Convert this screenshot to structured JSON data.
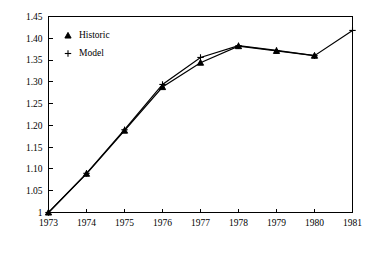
{
  "chart_data": {
    "type": "line",
    "title": "",
    "xlabel": "",
    "ylabel": "",
    "x": [
      1973,
      1974,
      1975,
      1976,
      1977,
      1978,
      1979,
      1980,
      1981
    ],
    "categories": [
      "1973",
      "1974",
      "1975",
      "1976",
      "1977",
      "1978",
      "1979",
      "1980",
      "1981"
    ],
    "xlim": [
      1973,
      1981
    ],
    "ylim": [
      1.0,
      1.45
    ],
    "grid": false,
    "legend_position": "top-left",
    "xtick_labels": [
      "1973",
      "1974",
      "1975",
      "1976",
      "1977",
      "1978",
      "1979",
      "1980",
      "1981"
    ],
    "ytick_labels": [
      "1",
      "1.05",
      "1.10",
      "1.15",
      "1.20",
      "1.25",
      "1.30",
      "1.35",
      "1.40",
      "1.45"
    ],
    "ytick_values": [
      1.0,
      1.05,
      1.1,
      1.15,
      1.2,
      1.25,
      1.3,
      1.35,
      1.4,
      1.45
    ],
    "series": [
      {
        "name": "Historic",
        "marker": "triangle",
        "x": [
          1973,
          1974,
          1975,
          1976,
          1977,
          1978,
          1979,
          1980
        ],
        "values": [
          1.0,
          1.089,
          1.188,
          1.288,
          1.344,
          1.382,
          1.371,
          1.36
        ]
      },
      {
        "name": "Model",
        "marker": "plus",
        "x": [
          1973,
          1974,
          1975,
          1976,
          1977,
          1978,
          1979,
          1980,
          1981
        ],
        "values": [
          1.0,
          1.09,
          1.19,
          1.294,
          1.356,
          1.383,
          1.372,
          1.36,
          1.418
        ]
      }
    ]
  },
  "legend": {
    "entries": [
      {
        "label": "Historic",
        "marker": "triangle"
      },
      {
        "label": "Model",
        "marker": "plus"
      }
    ]
  },
  "colors": {
    "ink": "#000000",
    "background": "#ffffff"
  }
}
